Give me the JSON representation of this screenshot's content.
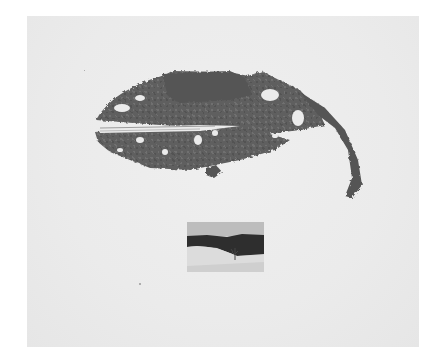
{
  "artwork": {
    "subject": "dried torn leaf collage with small landscape photograph",
    "background_color": "#ebebeb",
    "leaf_color": "#5e5e5e",
    "photo": {
      "description": "winter landscape with dark treeline, snowy foreground and bare tree",
      "sky_color": "#bdbdbd",
      "treeline_color": "#2e2e2e",
      "snow_color": "#dcdcdc"
    }
  }
}
